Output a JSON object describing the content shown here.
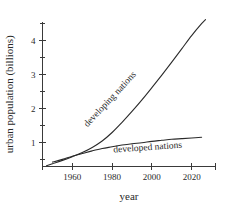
{
  "chart_data": {
    "type": "line",
    "title": "",
    "xlabel": "year",
    "ylabel": "urban population (billions)",
    "xlim": [
      1945,
      2032
    ],
    "ylim": [
      0.3,
      4.55
    ],
    "grid": false,
    "legend_position": "inline-labels",
    "x_ticks": [
      1960,
      1980,
      2000,
      2020
    ],
    "x_tick_labels": [
      "1960",
      "1980",
      "2000",
      "2020"
    ],
    "y_ticks": [
      1,
      2,
      3,
      4
    ],
    "y_tick_labels": [
      "1",
      "2",
      "3",
      "4"
    ],
    "y_minor_ticks": [
      0.5,
      1.5,
      2.5,
      3.5,
      4.5
    ],
    "series": [
      {
        "name": "developing nations",
        "label": "developing nations",
        "label_rotation_deg": -47,
        "x": [
          1947,
          1950,
          1955,
          1960,
          1965,
          1970,
          1975,
          1980,
          1985,
          1990,
          1995,
          2000,
          2005,
          2010,
          2015,
          2020,
          2025,
          2027
        ],
        "y": [
          0.32,
          0.38,
          0.48,
          0.59,
          0.71,
          0.86,
          1.05,
          1.3,
          1.6,
          1.92,
          2.26,
          2.62,
          2.99,
          3.37,
          3.76,
          4.15,
          4.5,
          4.62
        ]
      },
      {
        "name": "developed nations",
        "label": "developed nations",
        "label_rotation_deg": -4,
        "x": [
          1950,
          1955,
          1960,
          1965,
          1970,
          1975,
          1980,
          1985,
          1990,
          1995,
          2000,
          2005,
          2010,
          2015,
          2020,
          2025
        ],
        "y": [
          0.43,
          0.51,
          0.6,
          0.68,
          0.76,
          0.83,
          0.88,
          0.93,
          0.97,
          1.0,
          1.04,
          1.07,
          1.1,
          1.12,
          1.14,
          1.16
        ]
      }
    ],
    "colors": {
      "line": "#2a2a2a",
      "axis": "#3a3a3a",
      "background": "#ffffff"
    }
  }
}
